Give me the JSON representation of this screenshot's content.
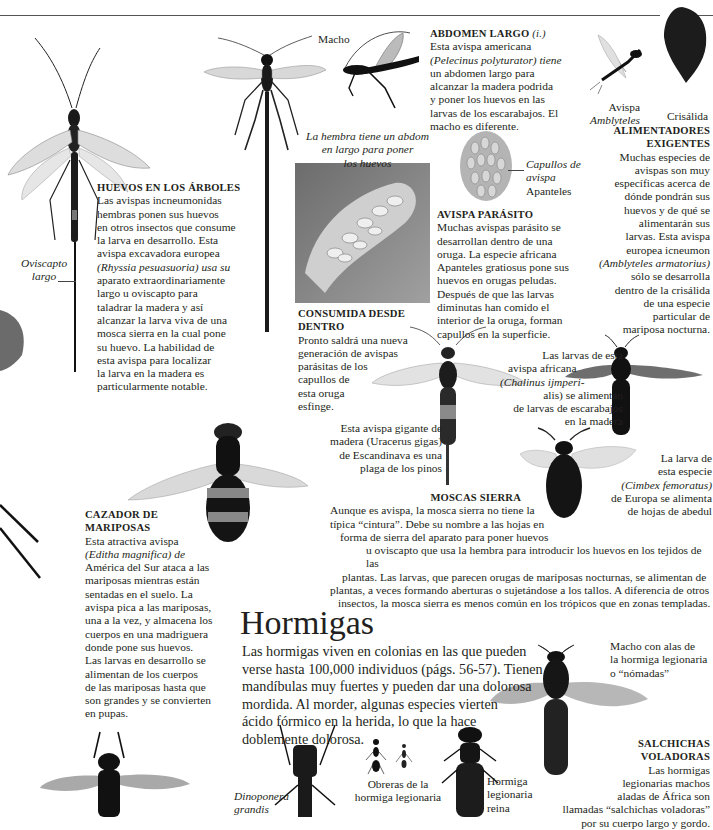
{
  "page": {
    "top_rule": true
  },
  "abdomen_largo": {
    "heading": "ABDOMEN LARGO",
    "heading_note": "(i.)",
    "lines": [
      "Esta avispa americana",
      "(Pelecinus polyturator) tiene",
      "un abdomen largo para",
      "alcanzar la madera podrida",
      "y poner los huevos en las",
      "larvas de los escarabajos. El",
      "macho es diferente."
    ]
  },
  "labels": {
    "macho": "Macho",
    "hembra_abdomen": [
      "La hembra tiene un abdom",
      "en largo para poner",
      "los huevos"
    ],
    "avispa_amblyteles": [
      "Avispa",
      "Amblyteles"
    ],
    "crisalida": "Crisálida",
    "capullos": [
      "Capullos de",
      "avispa",
      "Apanteles"
    ],
    "oviscapto": [
      "Oviscapto",
      "largo"
    ]
  },
  "alimentadores": {
    "heading": [
      "ALIMENTADORES",
      "EXIGENTES"
    ],
    "lines": [
      "Muchas especies de",
      "avispas son muy",
      "específicas acerca de",
      "dónde pondrán sus",
      "huevos y de qué se",
      "alimentarán sus",
      "larvas. Esta avispa",
      "europea icneumon",
      "(Amblyteles armatorius)",
      "sólo se desarrolla",
      "dentro de la crisálida",
      "de una especie",
      "particular de",
      "mariposa nocturna."
    ]
  },
  "huevos_arboles": {
    "heading": "HUEVOS EN LOS ÁRBOLES",
    "lines": [
      "Las avispas incneumonidas",
      "hembras ponen sus huevos",
      "en otros insectos que consume",
      "la larva en desarrollo. Esta",
      "avispa excavadora europea",
      "(Rhyssia pesuasuoria) usa su",
      "aparato extraordinariamente",
      "largo u oviscapto para",
      "taladrar la madera y así",
      "alcanzar la larva viva de una",
      "mosca sierra en la cual pone",
      "su huevo. La habilidad de",
      "esta avispa para localizar",
      "la larva en la madera es",
      "particularmente notable."
    ]
  },
  "avispa_parasito": {
    "heading": "AVISPA PARÁSITO",
    "lines": [
      "Muchas avispas parásito se",
      "desarrollan dentro de una",
      "oruga. La especie africana",
      "Apanteles gratiosus pone sus",
      "huevos en orugas peludas.",
      "Después de que las larvas",
      "diminutas han comido el",
      "interior de la oruga, forman",
      "capullos en la superficie."
    ]
  },
  "consumida": {
    "heading": "CONSUMIDA DESDE DENTRO",
    "lines": [
      "Pronto saldrá una nueva",
      "generación de avispas",
      "parásitas de los",
      "capullos de",
      "esta oruga",
      "esfinge."
    ]
  },
  "chalinus": {
    "lines": [
      "Las larvas de esta",
      "avispa africana",
      "(Chalinus ijmperi-",
      "alis) se alimentan",
      "de larvas de escarabajos",
      "en la madera"
    ]
  },
  "uracerus": {
    "lines": [
      "Esta avispa gigante de",
      "madera (Uracerus gigas)",
      "de Escandinava es una",
      "plaga de los pinos"
    ]
  },
  "cimbex": {
    "lines": [
      "La larva de",
      "esta especie",
      "(Cimbex femoratus)",
      "de Europa se alimenta",
      "de hojas de abedul"
    ]
  },
  "moscas_sierra": {
    "heading": "MOSCAS SIERRA",
    "lines": [
      "Aunque es avispa, la mosca sierra no tiene la",
      "típica “cintura”. Debe su nombre a las hojas en",
      "forma de sierra del aparato para poner huevos",
      "u oviscapto que usa la hembra para introducir los huevos en los tejidos de las",
      "plantas. Las larvas, que parecen orugas de mariposas nocturnas, se alimentan de",
      "plantas, a veces formando aberturas o sujetándose a los tallos. A diferencia de otros",
      "insectos, la mosca sierra es menos común en los trópicos que en zonas templadas."
    ]
  },
  "cazador": {
    "heading": [
      "CAZADOR DE",
      "MARIPOSAS"
    ],
    "lines": [
      "Esta atractiva avispa",
      "(Editha magnifica) de",
      "América del Sur ataca a las",
      "mariposas mientras están",
      "sentadas en el suelo. La",
      "avispa pica a las mariposas,",
      "una a la vez, y almacena los",
      "cuerpos en una madriguera",
      "donde pone sus huevos.",
      "Las larvas en desarrollo se",
      "alimentan de los cuerpos",
      "de las mariposas hasta que",
      "son grandes y se convierten",
      "en pupas."
    ]
  },
  "hormigas": {
    "title": "Hormigas",
    "lines": [
      "Las hormigas viven en colonias en las que pueden",
      "verse hasta 100,000 individuos (págs. 56-57). Tienen",
      "mandíbulas muy fuertes y pueden dar una dolorosa",
      "mordida. Al morder, algunas especies vierten",
      "ácido fórmico en la herida, lo que la hace",
      "doblemente dolorosa."
    ]
  },
  "ant_labels": {
    "macho_alas": [
      "Macho con alas de",
      "la hormiga legionaria",
      "o “nómadas”"
    ],
    "obreras": [
      "Obreras de la",
      "hormiga legionaria"
    ],
    "reina": [
      "Hormiga",
      "legionaria",
      "reina"
    ],
    "dinoponera": [
      "Dinoponera",
      "grandis"
    ]
  },
  "salchichas": {
    "heading": [
      "SALCHICHAS",
      "VOLADORAS"
    ],
    "lines": [
      "Las hormigas",
      "legionarias machos",
      "aladas de África son",
      "llamadas “salchichas voladoras”",
      "por su cuerpo largo y gordo."
    ]
  }
}
